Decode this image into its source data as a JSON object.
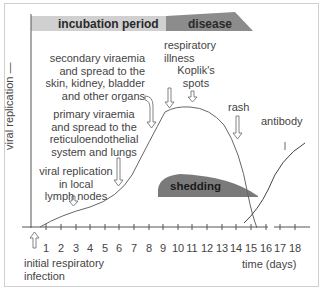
{
  "header": {
    "incubation_label": "incubation period",
    "disease_label": "disease",
    "incubation_color": "#d0d0d0",
    "disease_color": "#8c8c8c"
  },
  "axes": {
    "y_label": "viral replication —",
    "x_label": "time (days)",
    "x_ticks": [
      "1",
      "2",
      "3",
      "4",
      "5",
      "6",
      "7",
      "8",
      "9",
      "10",
      "11",
      "12",
      "13",
      "14",
      "15",
      "16",
      "17",
      "18"
    ]
  },
  "annotations": {
    "secondary": [
      "secondary viraemia",
      "and spread to the",
      "skin, kidney, bladder",
      "and other organs"
    ],
    "primary": [
      "primary viraemia",
      "and spread to the",
      "reticuloendothelial",
      "system and lungs"
    ],
    "local": [
      "viral replication",
      "in local",
      "lymph nodes"
    ],
    "respiratory": [
      "respiratory",
      "illness"
    ],
    "koplik": [
      "Koplik's",
      "spots"
    ],
    "rash": "rash",
    "antibody": "antibody",
    "shedding": "shedding",
    "initial": [
      "initial respiratory",
      "infection"
    ]
  },
  "colors": {
    "shedding_fill": "#7a7a7a",
    "curve": "#555555"
  }
}
